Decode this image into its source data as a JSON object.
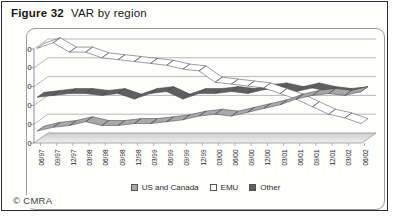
{
  "figure": {
    "label": "Figure 32",
    "title": "VAR by region"
  },
  "copyright": "© CMRA",
  "legend": [
    {
      "label": "US and Canada",
      "color": "#a8a8a8"
    },
    {
      "label": "EMU",
      "color": "#ffffff"
    },
    {
      "label": "Other",
      "color": "#5f5f5f"
    }
  ],
  "chart_data": {
    "type": "line",
    "variant": "3d-ribbon",
    "title": "VAR by region",
    "xlabel": "",
    "ylabel": "",
    "ylim": [
      0,
      50
    ],
    "yticks": [
      0,
      10,
      20,
      30,
      40,
      50
    ],
    "grid": true,
    "legend_position": "bottom",
    "categories": [
      "06/97",
      "09/97",
      "12/97",
      "03/98",
      "06/98",
      "09/98",
      "12/98",
      "03/99",
      "06/99",
      "09/99",
      "12/99",
      "03/00",
      "06/00",
      "09/00",
      "12/00",
      "03/01",
      "06/01",
      "09/01",
      "12/01",
      "03/02",
      "06/02"
    ],
    "series": [
      {
        "name": "US and Canada",
        "color": "#a8a8a8",
        "values": [
          5,
          7,
          8,
          10,
          8,
          8,
          9,
          9,
          10,
          11,
          13,
          14,
          13,
          15,
          17,
          19,
          22,
          24,
          25,
          24,
          26
        ]
      },
      {
        "name": "EMU",
        "color": "#ffffff",
        "values": [
          49,
          52,
          47,
          47,
          44,
          43,
          42,
          41,
          40,
          38,
          37,
          31,
          30,
          29,
          28,
          25,
          22,
          18,
          14,
          12,
          9
        ]
      },
      {
        "name": "Other",
        "color": "#5f5f5f",
        "values": [
          23,
          24,
          25,
          25,
          24,
          25,
          22,
          25,
          26,
          22,
          25,
          25,
          26,
          25,
          27,
          28,
          26,
          28,
          26,
          25,
          26
        ]
      }
    ]
  }
}
